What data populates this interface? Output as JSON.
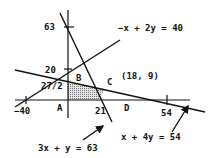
{
  "diagram": {
    "type": "linear-programming-feasible-region",
    "colors": {
      "ink": "#111111",
      "shade": "#c8c8c8",
      "background": "#ffffff"
    },
    "axes": {
      "x_ticks": [
        {
          "value": -40,
          "label": "−40"
        },
        {
          "value": 21,
          "label": "21"
        },
        {
          "value": 54,
          "label": "54"
        }
      ],
      "y_ticks": [
        {
          "value": 63,
          "label": "63"
        },
        {
          "value": 20,
          "label": "20"
        },
        {
          "value": 13.5,
          "label": "27/2"
        }
      ]
    },
    "constraints": [
      {
        "id": "c1",
        "equation": "3x + y = 63"
      },
      {
        "id": "c2",
        "equation": "−x + 2y = 40"
      },
      {
        "id": "c3",
        "equation": "x + 4y = 54"
      }
    ],
    "vertices": [
      {
        "name": "A",
        "label": "A",
        "coords": [
          0,
          0
        ]
      },
      {
        "name": "B",
        "label": "B",
        "coords": [
          0,
          13.5
        ]
      },
      {
        "name": "C",
        "label": "C",
        "coords": [
          18,
          9
        ],
        "coord_label": "(18, 9)"
      },
      {
        "name": "D",
        "label": "D",
        "coords": [
          21,
          0
        ]
      }
    ],
    "feasible_region": [
      "A",
      "B",
      "C",
      "D"
    ]
  }
}
